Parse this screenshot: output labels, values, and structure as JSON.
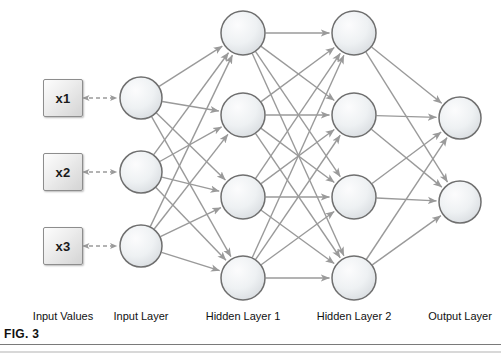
{
  "figure": {
    "caption": "FIG. 3"
  },
  "colors": {
    "connection": "#9a9a9a",
    "node_stroke": "#6f6f6f",
    "node_fill_light": "#fbfbfb",
    "node_fill_dark": "#d9dde0",
    "box_border": "#8d8d8d",
    "text": "#111111",
    "dashed_arrow": "#9a9a9a"
  },
  "input_values": [
    {
      "label": "x1",
      "x": 63,
      "y": 98
    },
    {
      "label": "x2",
      "x": 63,
      "y": 172
    },
    {
      "label": "x3",
      "x": 63,
      "y": 246
    }
  ],
  "layers": [
    {
      "name": "input-layer",
      "label": "Input Layer",
      "label_x": 141,
      "cx": 141,
      "radius": 21,
      "nodes": [
        {
          "cy": 98
        },
        {
          "cy": 172
        },
        {
          "cy": 246
        }
      ]
    },
    {
      "name": "hidden-layer-1",
      "label": "Hidden Layer 1",
      "label_x": 243,
      "cx": 243,
      "radius": 22,
      "nodes": [
        {
          "cy": 33
        },
        {
          "cy": 115
        },
        {
          "cy": 197
        },
        {
          "cy": 278
        }
      ]
    },
    {
      "name": "hidden-layer-2",
      "label": "Hidden Layer 2",
      "label_x": 354,
      "cx": 354,
      "radius": 22,
      "nodes": [
        {
          "cy": 33
        },
        {
          "cy": 115
        },
        {
          "cy": 197
        },
        {
          "cy": 278
        }
      ]
    },
    {
      "name": "output-layer",
      "label": "Output Layer",
      "label_x": 460,
      "cx": 460,
      "radius": 21,
      "nodes": [
        {
          "cy": 118
        },
        {
          "cy": 202
        }
      ]
    }
  ],
  "input_values_label": {
    "label": "Input Values",
    "label_x": 63
  },
  "labels_y": 316
}
